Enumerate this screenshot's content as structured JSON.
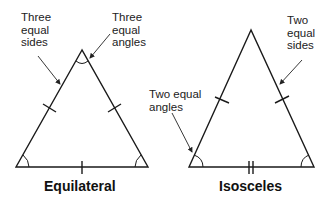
{
  "equilateral": {
    "title": "Equilateral",
    "annotations": {
      "sides": [
        "Three",
        "equal",
        "sides"
      ],
      "angles": [
        "Three",
        "equal",
        "angles"
      ]
    }
  },
  "isosceles": {
    "title": "Isosceles",
    "annotations": {
      "sides": [
        "Two",
        "equal",
        "sides"
      ],
      "angles": [
        "Two equal",
        "angles"
      ]
    }
  }
}
